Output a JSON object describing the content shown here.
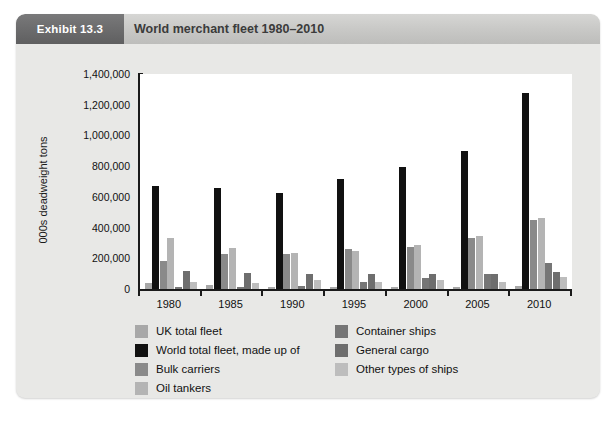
{
  "exhibit": {
    "tag": "Exhibit 13.3",
    "title": "World merchant fleet 1980–2010"
  },
  "chart_data": {
    "type": "bar",
    "title": "World merchant fleet 1980–2010",
    "xlabel": "",
    "ylabel": "000s deadweight tons",
    "ylim": [
      0,
      1400000
    ],
    "ytick_values": [
      0,
      200000,
      400000,
      600000,
      800000,
      1000000,
      1200000,
      1400000
    ],
    "ytick_labels": [
      "0",
      "200,000",
      "400,000",
      "600,000",
      "800,000",
      "1,000,000",
      "1,200,000",
      "1,400,000"
    ],
    "grid": false,
    "legend_position": "bottom",
    "categories": [
      "1980",
      "1985",
      "1990",
      "1995",
      "2000",
      "2005",
      "2010"
    ],
    "series": [
      {
        "name": "UK total fleet",
        "color": "#a8a8a8",
        "values": [
          40000,
          25000,
          10000,
          14000,
          15000,
          16000,
          18000
        ]
      },
      {
        "name": "World total fleet, made up of",
        "color": "#111111",
        "values": [
          670000,
          660000,
          625000,
          715000,
          795000,
          900000,
          1275000
        ]
      },
      {
        "name": "Bulk carriers",
        "color": "#8a8a8a",
        "values": [
          180000,
          225000,
          230000,
          260000,
          275000,
          330000,
          450000
        ]
      },
      {
        "name": "Oil tankers",
        "color": "#b4b4b4",
        "values": [
          335000,
          270000,
          235000,
          250000,
          285000,
          345000,
          460000
        ]
      },
      {
        "name": "Container ships",
        "color": "#767676",
        "values": [
          10000,
          14000,
          22000,
          44000,
          70000,
          100000,
          170000
        ]
      },
      {
        "name": "General cargo",
        "color": "#6e6e6e",
        "values": [
          118000,
          105000,
          100000,
          100000,
          95000,
          95000,
          110000
        ]
      },
      {
        "name": "Other types of ships",
        "color": "#bdbdbd",
        "values": [
          45000,
          42000,
          60000,
          45000,
          60000,
          48000,
          80000
        ]
      }
    ]
  },
  "legend": {
    "left_column": [
      {
        "label": "UK total fleet",
        "color": "#a8a8a8"
      },
      {
        "label": "World total fleet, made up of",
        "color": "#111111"
      },
      {
        "label": "Bulk carriers",
        "color": "#8a8a8a"
      },
      {
        "label": "Oil tankers",
        "color": "#b4b4b4"
      }
    ],
    "right_column": [
      {
        "label": "Container ships",
        "color": "#767676"
      },
      {
        "label": "General cargo",
        "color": "#6e6e6e"
      },
      {
        "label": "Other types of ships",
        "color": "#bdbdbd"
      }
    ]
  }
}
